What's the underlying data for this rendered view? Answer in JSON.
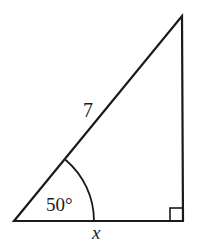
{
  "diagram": {
    "type": "right-triangle",
    "hypotenuse_label": "7",
    "angle_label": "50°",
    "base_label": "x",
    "right_angle_marker": true,
    "stroke_color": "#1a1a1a",
    "background": "#ffffff"
  }
}
